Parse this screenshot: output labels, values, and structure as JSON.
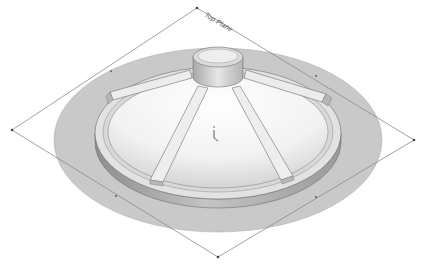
{
  "viewport": {
    "width": 433,
    "height": 267,
    "background": "#ffffff"
  },
  "reference_plane": {
    "label": "Top Plane",
    "edge_color": "#8a8a8a",
    "corners": {
      "top": [
        197,
        8
      ],
      "right": [
        414,
        140
      ],
      "bottom": [
        218,
        257
      ],
      "left": [
        12,
        130
      ]
    }
  },
  "model": {
    "description": "Revolved disc with conical dome, central boss and five radial ribs",
    "colors": {
      "flange": "#c9c9c9",
      "flange_edge": "#9a9a9a",
      "rim_side": "#a5a5a5",
      "rim_top": "#e2e2e2",
      "dome": "#f2f2f2",
      "boss": "#dadada",
      "rib": "#ececec",
      "outline": "#6f6f6f"
    },
    "rib_count": 5
  },
  "origin_marker": {
    "symbol": "origin-triad",
    "position": [
      214,
      137
    ]
  }
}
